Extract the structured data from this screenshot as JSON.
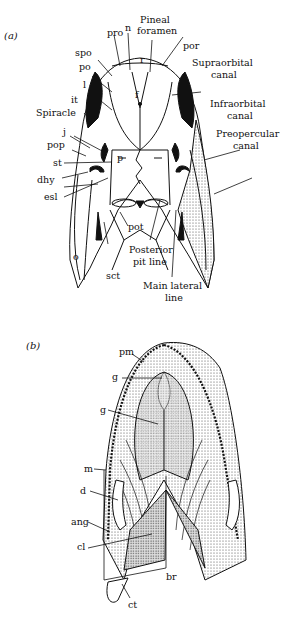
{
  "figure": {
    "panels": [
      {
        "id": "a",
        "label": "(a)",
        "view": "dorsal skull roof",
        "labels": {
          "pro": "pro",
          "n": "n",
          "pineal": "Pineal",
          "foramen": "foramen",
          "spo": "spo",
          "r": "r",
          "por": "por",
          "po": "po",
          "supraorbital1": "Supraorbital",
          "supraorbital2": "canal",
          "l": "l",
          "f": "f",
          "it": "it",
          "infraorbital1": "Infraorbital",
          "infraorbital2": "canal",
          "spiracle": "Spiracle",
          "j": "j",
          "preopercular1": "Preopercular",
          "preopercular2": "canal",
          "pop": "pop",
          "st": "st",
          "p": "p",
          "dhy": "dhy",
          "esl": "esl",
          "pot": "pot",
          "o": "o",
          "sct": "sct",
          "posterior1": "Posterior",
          "posterior2": "pit line",
          "main1": "Main lateral",
          "main2": "line"
        }
      },
      {
        "id": "b",
        "label": "(b)",
        "view": "ventral",
        "labels": {
          "pm": "pm",
          "g1": "g",
          "g2": "g",
          "m": "m",
          "d": "d",
          "ang": "ang",
          "cl": "cl",
          "br": "br",
          "ct": "ct"
        }
      }
    ]
  }
}
